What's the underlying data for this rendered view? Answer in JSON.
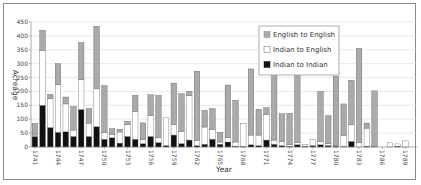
{
  "chart_data": {
    "type": "bar",
    "stacked": true,
    "title": "",
    "xlabel": "Year",
    "ylabel": "Acreage",
    "ylim": [
      0,
      450
    ],
    "yticks": [
      0,
      50,
      100,
      150,
      200,
      250,
      300,
      350,
      400,
      450
    ],
    "grid": true,
    "legend_position": "upper right",
    "x_tick_labels": [
      "1741",
      "1744",
      "1747",
      "1750",
      "1753",
      "1756",
      "1759",
      "1762",
      "1765",
      "1768",
      "1771",
      "1774",
      "1777",
      "1780",
      "1783",
      "1786",
      "1789"
    ],
    "categories": [
      "1741",
      "1742",
      "1743",
      "1744",
      "1745",
      "1746",
      "1747",
      "1748",
      "1749",
      "1750",
      "1751",
      "1752",
      "1753",
      "1754",
      "1755",
      "1756",
      "1757",
      "1758",
      "1759",
      "1760",
      "1761",
      "1762",
      "1763",
      "1764",
      "1765",
      "1766",
      "1767",
      "1768",
      "1769",
      "1770",
      "1771",
      "1772",
      "1773",
      "1774",
      "1775",
      "1776",
      "1777",
      "1778",
      "1779",
      "1780",
      "1781",
      "1782",
      "1783",
      "1784",
      "1785",
      "1786",
      "1787",
      "1788",
      "1789",
      "1790"
    ],
    "series": [
      {
        "name": "Indian to Indian",
        "color": "#111111",
        "values": [
          38,
          150,
          70,
          53,
          55,
          38,
          135,
          38,
          73,
          28,
          33,
          14,
          38,
          28,
          12,
          38,
          16,
          5,
          43,
          12,
          25,
          5,
          10,
          28,
          10,
          18,
          3,
          2,
          8,
          5,
          25,
          10,
          5,
          3,
          8,
          3,
          5,
          8,
          5,
          3,
          2,
          20,
          0,
          3,
          0,
          0,
          0,
          3,
          0,
          0
        ]
      },
      {
        "name": "Indian to English",
        "color": "#ffffff",
        "values": [
          5,
          198,
          104,
          172,
          100,
          23,
          108,
          48,
          137,
          25,
          13,
          40,
          42,
          100,
          15,
          75,
          17,
          100,
          37,
          45,
          160,
          18,
          62,
          35,
          8,
          15,
          15,
          83,
          35,
          38,
          92,
          15,
          15,
          5,
          8,
          5,
          22,
          12,
          8,
          2,
          40,
          60,
          15,
          65,
          2,
          0,
          15,
          8,
          22,
          0
        ]
      },
      {
        "name": "English to English",
        "color": "#aaaaaa",
        "values": [
          42,
          72,
          15,
          75,
          25,
          85,
          133,
          53,
          225,
          168,
          20,
          10,
          12,
          58,
          60,
          75,
          153,
          0,
          150,
          135,
          15,
          250,
          60,
          75,
          35,
          190,
          150,
          0,
          238,
          93,
          25,
          300,
          100,
          113,
          290,
          0,
          0,
          180,
          100,
          250,
          113,
          160,
          340,
          18,
          200,
          0,
          0,
          0,
          0,
          0
        ]
      }
    ]
  },
  "legend": {
    "items": [
      {
        "label": "English to English",
        "color": "#aaaaaa"
      },
      {
        "label": "Indian to English",
        "color": "#ffffff"
      },
      {
        "label": "Indian to Indian",
        "color": "#111111"
      }
    ]
  },
  "axes": {
    "x_title": "Year",
    "y_title": "Acreage"
  }
}
